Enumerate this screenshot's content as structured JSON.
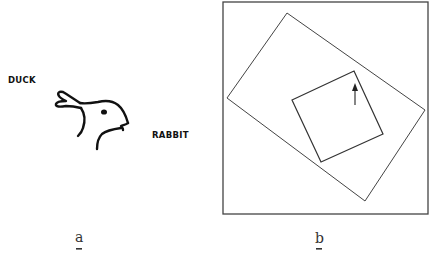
{
  "figure": {
    "panels": [
      {
        "id": "a",
        "label": "a",
        "annotations": {
          "left": "DUCK",
          "right": "RABBIT"
        },
        "illustration": "duck-rabbit ambiguous figure"
      },
      {
        "id": "b",
        "label": "b",
        "illustration": "nested rotated frames with arrow"
      }
    ]
  },
  "colors": {
    "ink": "#111111",
    "thin_line": "#444444",
    "label": "#333333",
    "background": "#ffffff"
  }
}
